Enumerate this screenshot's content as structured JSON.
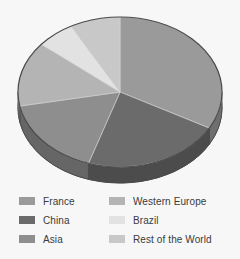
{
  "chart_data": {
    "type": "pie",
    "title": "",
    "subtitle": "",
    "xlabel": "",
    "ylabel": "",
    "legend_position": "bottom",
    "grid": false,
    "three_d": true,
    "start_angle_deg": 0,
    "direction": "clockwise",
    "categories": [
      "France",
      "China",
      "Asia",
      "Western Europe",
      "Brazil",
      "Rest of the World"
    ],
    "values": [
      33,
      22,
      17,
      14,
      6,
      8
    ],
    "slices": [
      {
        "label": "France",
        "value": 33,
        "color": "#9a9a9a",
        "side_color": "#6f6f6f",
        "start_deg": 0,
        "end_deg": 118.8
      },
      {
        "label": "China",
        "value": 22,
        "color": "#6b6b6b",
        "side_color": "#4c4c4c",
        "start_deg": 118.8,
        "end_deg": 198.0
      },
      {
        "label": "Asia",
        "value": 17,
        "color": "#8e8e8e",
        "side_color": "#666666",
        "start_deg": 198.0,
        "end_deg": 259.2
      },
      {
        "label": "Western Europe",
        "value": 14,
        "color": "#b4b4b4",
        "side_color": "#828282",
        "start_deg": 259.2,
        "end_deg": 309.6
      },
      {
        "label": "Brazil",
        "value": 6,
        "color": "#e2e2e2",
        "side_color": "#a2a2a2",
        "start_deg": 309.6,
        "end_deg": 331.2
      },
      {
        "label": "Rest of the World",
        "value": 8,
        "color": "#c8c8c8",
        "side_color": "#909090",
        "start_deg": 331.2,
        "end_deg": 360.0
      }
    ]
  },
  "legend": {
    "left_column": [
      {
        "label": "France",
        "color": "#9a9a9a"
      },
      {
        "label": "China",
        "color": "#6b6b6b"
      },
      {
        "label": "Asia",
        "color": "#8e8e8e"
      }
    ],
    "right_column": [
      {
        "label": "Western Europe",
        "color": "#b4b4b4"
      },
      {
        "label": "Brazil",
        "color": "#e2e2e2"
      },
      {
        "label": "Rest of the World",
        "color": "#c8c8c8"
      }
    ]
  },
  "style": {
    "background": "#f7f7f7",
    "outline": "#4a4a4a",
    "text_color": "#3a3a3a"
  }
}
